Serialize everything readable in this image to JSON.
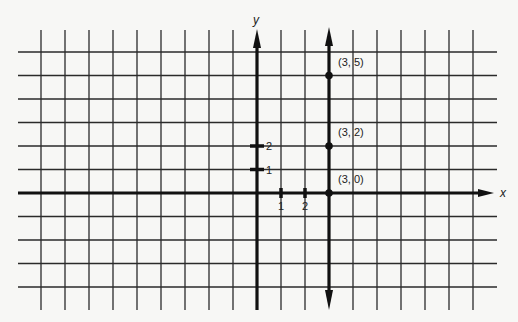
{
  "chart_data": {
    "type": "scatter",
    "title": "",
    "xlabel": "x",
    "ylabel": "y",
    "grid": true,
    "xlim": [
      -9,
      9
    ],
    "ylim": [
      -4,
      6
    ],
    "x_ticks_labeled": [
      {
        "value": 1,
        "label": "1"
      },
      {
        "value": 2,
        "label": "2"
      }
    ],
    "y_ticks_labeled": [
      {
        "value": 1,
        "label": "1"
      },
      {
        "value": 2,
        "label": "2"
      }
    ],
    "vertical_line": {
      "x": 3,
      "description": "line x = 3"
    },
    "points": [
      {
        "x": 3,
        "y": 5,
        "label": "(3, 5)"
      },
      {
        "x": 3,
        "y": 2,
        "label": "(3, 2)"
      },
      {
        "x": 3,
        "y": 0,
        "label": "(3, 0)"
      }
    ],
    "colors": {
      "ink": "#111111",
      "grid": "#2a2a2a",
      "paper": "#f7f7f5"
    }
  }
}
